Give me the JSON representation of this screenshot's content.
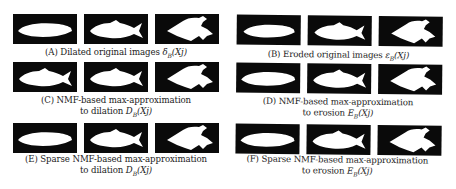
{
  "figure": {
    "panels": [
      {
        "id": "A",
        "caption_lines": [
          "(A) Dilated original images δB(Xj)"
        ],
        "caption_label": "(A)",
        "caption_text": "Dilated original images",
        "caption_math": "δ",
        "caption_math_sub": "B",
        "caption_math_arg": "(Xj)",
        "images": [
          "dilated-fish-1",
          "dilated-fish-2",
          "dilated-fish-3"
        ]
      },
      {
        "id": "B",
        "caption_label": "(B)",
        "caption_text": "Eroded original images",
        "caption_math": "ε",
        "caption_math_sub": "B",
        "caption_math_arg": "(Xj)",
        "images": [
          "eroded-fish-1",
          "eroded-fish-2",
          "eroded-fish-3"
        ]
      },
      {
        "id": "C",
        "caption_label": "(C)",
        "caption_line1": "NMF-based max-approximation",
        "caption_line2_text": "to dilation",
        "caption_math": "D",
        "caption_math_sub": "B",
        "caption_math_arg": "(Xj)",
        "images": [
          "nmf-dilation-fish-1",
          "nmf-dilation-fish-2",
          "nmf-dilation-fish-3"
        ]
      },
      {
        "id": "D",
        "caption_label": "(D)",
        "caption_line1": "NMF-based max-approximation",
        "caption_line2_text": "to erosion",
        "caption_math": "E",
        "caption_math_sub": "B",
        "caption_math_arg": "(Xj)",
        "images": [
          "nmf-erosion-fish-1",
          "nmf-erosion-fish-2",
          "nmf-erosion-fish-3"
        ]
      },
      {
        "id": "E",
        "caption_label": "(E)",
        "caption_line1": "Sparse NMF-based max-approximation",
        "caption_line2_text": "to dilation",
        "caption_math": "D",
        "caption_math_sub": "B",
        "caption_math_arg": "(Xj)",
        "images": [
          "sparse-nmf-dilation-fish-1",
          "sparse-nmf-dilation-fish-2",
          "sparse-nmf-dilation-fish-3"
        ]
      },
      {
        "id": "F",
        "caption_label": "(F)",
        "caption_line1": "Sparse NMF-based max-approximation",
        "caption_line2_text": "to erosion",
        "caption_math": "E",
        "caption_math_sub": "B",
        "caption_math_arg": "(Xj)",
        "images": [
          "sparse-nmf-erosion-fish-1",
          "sparse-nmf-erosion-fish-2",
          "sparse-nmf-erosion-fish-3"
        ]
      }
    ],
    "colors": {
      "tile_background": "#0a0a0a",
      "shape_fill": "#ffffff",
      "text": "#222222"
    }
  }
}
